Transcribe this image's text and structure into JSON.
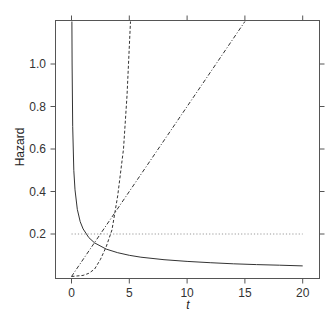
{
  "chart_data": {
    "type": "line",
    "title": "",
    "xlabel": "t",
    "ylabel": "Hazard",
    "xlim": [
      -1.2,
      21.2
    ],
    "ylim": [
      0,
      1.2
    ],
    "x_ticks": [
      0,
      5,
      10,
      15,
      20
    ],
    "x_tick_labels": [
      "0",
      "5",
      "10",
      "15",
      "20"
    ],
    "y_ticks": [
      0.2,
      0.4,
      0.6,
      0.8,
      1.0
    ],
    "y_tick_labels": [
      "0.2",
      "0.4",
      "0.6",
      "0.8",
      "1.0"
    ],
    "grid": false,
    "legend": null,
    "series": [
      {
        "name": "decreasing hazard",
        "style": "solid",
        "x": [
          0.035,
          0.05,
          0.1,
          0.2,
          0.3,
          0.5,
          0.75,
          1,
          1.5,
          2,
          3,
          4,
          5,
          6,
          8,
          10,
          12,
          14,
          16,
          18,
          20
        ],
        "y": [
          1.2,
          1.0,
          0.707,
          0.5,
          0.408,
          0.316,
          0.258,
          0.224,
          0.183,
          0.158,
          0.129,
          0.112,
          0.1,
          0.091,
          0.079,
          0.071,
          0.065,
          0.06,
          0.056,
          0.053,
          0.05
        ]
      },
      {
        "name": "constant hazard",
        "style": "dotted",
        "x": [
          0,
          20
        ],
        "y": [
          0.2,
          0.2
        ]
      },
      {
        "name": "linearly increasing hazard",
        "style": "dashdot",
        "x": [
          0,
          5,
          10,
          15
        ],
        "y": [
          0,
          0.4,
          0.8,
          1.2
        ]
      },
      {
        "name": "steeply increasing hazard",
        "style": "dashed",
        "x": [
          0,
          1,
          1.5,
          2,
          2.5,
          3,
          3.5,
          4,
          4.5,
          4.8,
          5.1
        ],
        "y": [
          0,
          0.005,
          0.015,
          0.035,
          0.08,
          0.14,
          0.22,
          0.38,
          0.6,
          0.85,
          1.2
        ]
      }
    ]
  },
  "colors": {
    "frame": "#555555",
    "line": "#333333",
    "dotted": "#999999"
  }
}
